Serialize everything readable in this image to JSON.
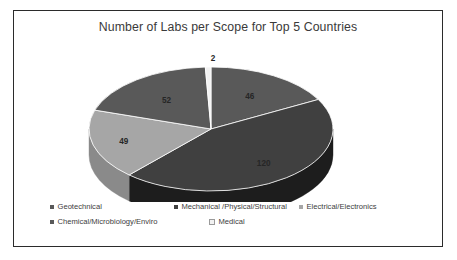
{
  "frame": {
    "border_color": "#2b2b2b",
    "background": "#ffffff"
  },
  "chart_data": {
    "type": "pie",
    "title": "Number of Labs per Scope for Top 5 Countries",
    "xlabel": "",
    "ylabel": "",
    "three_d": true,
    "legend_position": "bottom",
    "grid": false,
    "total": 269,
    "categories": [
      "Geotechnical",
      "Mechanical /Physical/Structural",
      "Electrical/Electronics",
      "Chemical/Microbiology/Enviro",
      "Medical"
    ],
    "values": [
      46,
      120,
      49,
      52,
      2
    ],
    "data_labels": [
      "46",
      "120",
      "49",
      "52",
      "2"
    ],
    "colors": [
      "#595959",
      "#404040",
      "#a6a6a6",
      "#595959",
      "#f2f2f2"
    ]
  },
  "slices": [
    {
      "label": "46",
      "value": 46,
      "category": "Geotechnical",
      "color": "#595959",
      "side_color": "#3f3f3f"
    },
    {
      "label": "120",
      "value": 120,
      "category": "Mechanical /Physical/Structural",
      "color": "#404040",
      "side_color": "#1d1d1d"
    },
    {
      "label": "49",
      "value": 49,
      "category": "Electrical/Electronics",
      "color": "#a6a6a6",
      "side_color": "#8a8a8a"
    },
    {
      "label": "52",
      "value": 52,
      "category": "Chemical/Microbiology/Enviro",
      "color": "#595959",
      "side_color": "#3f3f3f"
    },
    {
      "label": "2",
      "value": 2,
      "category": "Medical",
      "color": "#f2f2f2",
      "side_color": "#d0d0d0"
    }
  ],
  "legend": {
    "row1": [
      {
        "label": "Geotechnical",
        "color": "#595959"
      },
      {
        "label": "Mechanical /Physical/Structural",
        "color": "#404040"
      },
      {
        "label": "Electrical/Electronics",
        "color": "#a6a6a6"
      }
    ],
    "row2": [
      {
        "label": "Chemical/Microbiology/Enviro",
        "color": "#595959"
      },
      {
        "label": "Medical",
        "color": "#f2f2f2"
      }
    ]
  }
}
